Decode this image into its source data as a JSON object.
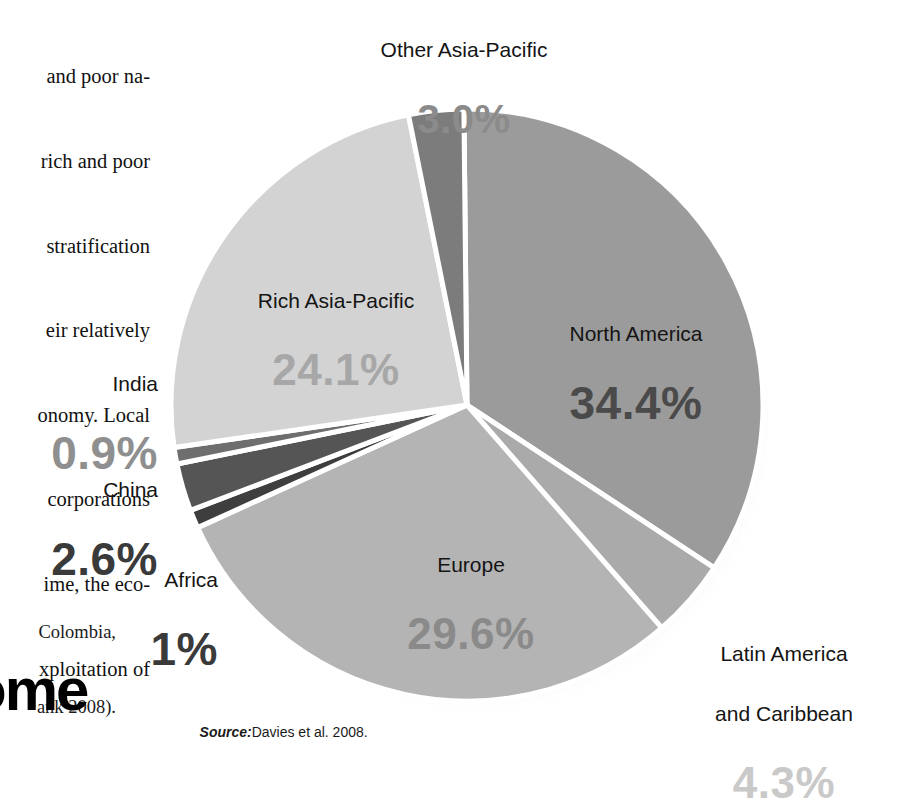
{
  "article": {
    "body_lines": [
      "and poor na-",
      "rich and poor",
      "stratification",
      "eir relatively",
      "onomy. Local",
      "corporations",
      "ime, the eco-",
      "xploitation of"
    ],
    "caption_lines": [
      "Colombia,",
      "ank 2008)."
    ],
    "headline": "ome",
    "source_prefix": "Source:",
    "source_text": "Davies et al. 2008."
  },
  "chart_data": {
    "type": "pie",
    "title": "",
    "source": "Source: Davies et al. 2008.",
    "legend_position": "callout-labels",
    "unit": "%",
    "categories": [
      "North America",
      "Latin America and Caribbean",
      "Europe",
      "Africa",
      "China",
      "India",
      "Rich Asia-Pacific",
      "Other Asia-Pacific"
    ],
    "values": [
      34.4,
      4.3,
      29.6,
      1.0,
      2.6,
      0.9,
      24.1,
      3.0
    ],
    "value_labels": [
      "34.4%",
      "4.3%",
      "29.6%",
      "1%",
      "2.6%",
      "0.9%",
      "24.1%",
      "3.0%"
    ],
    "slice_colors": [
      "#9b9b9b",
      "#aaaaaa",
      "#b4b4b4",
      "#3e3e3e",
      "#555555",
      "#6e6e6e",
      "#d3d3d3",
      "#7c7c7c"
    ],
    "label_colors": [
      "#4a4a4a",
      "#c9c9c9",
      "#8a8a8a",
      "#3a3a3a",
      "#3a3a3a",
      "#8f8f8f",
      "#a7a7a7",
      "#8b8b8b"
    ],
    "slices": [
      {
        "label": "North America",
        "value": 34.4,
        "display": "34.4%"
      },
      {
        "label": "Latin America and Caribbean",
        "value": 4.3,
        "display": "4.3%"
      },
      {
        "label": "Europe",
        "value": 29.6,
        "display": "29.6%"
      },
      {
        "label": "Africa",
        "value": 1.0,
        "display": "1%"
      },
      {
        "label": "China",
        "value": 2.6,
        "display": "2.6%"
      },
      {
        "label": "India",
        "value": 0.9,
        "display": "0.9%"
      },
      {
        "label": "Rich Asia-Pacific",
        "value": 24.1,
        "display": "24.1%"
      },
      {
        "label": "Other Asia-Pacific",
        "value": 3.0,
        "display": "3.0%"
      }
    ]
  },
  "labels": {
    "other_asia_pacific": {
      "name": "Other Asia-Pacific",
      "pct": "3.0%"
    },
    "rich_asia_pacific": {
      "name": "Rich Asia-Pacific",
      "pct": "24.1%"
    },
    "north_america": {
      "name": "North America",
      "pct": "34.4%"
    },
    "europe": {
      "name": "Europe",
      "pct": "29.6%"
    },
    "india": {
      "name": "India",
      "pct": "0.9%"
    },
    "china": {
      "name": "China",
      "pct": "2.6%"
    },
    "africa": {
      "name": "Africa",
      "pct": "1%"
    },
    "latin_america": {
      "name_line1": "Latin America",
      "name_line2": "and Caribbean",
      "pct": "4.3%"
    }
  }
}
